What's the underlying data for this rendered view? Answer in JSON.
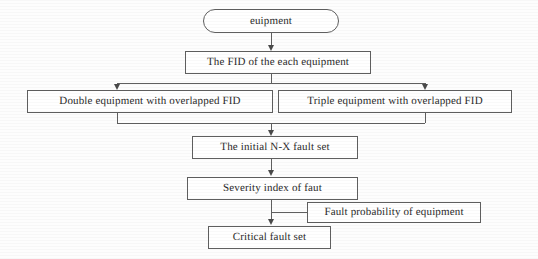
{
  "diagram": {
    "type": "flowchart",
    "orientation": "top-to-bottom",
    "background_color": "#fdfdfd",
    "line_color": "#5f5f5f",
    "text_color": "#2b2b2b",
    "nodes": [
      {
        "id": "start",
        "shape": "oval",
        "label": "euipment"
      },
      {
        "id": "fid",
        "shape": "rectangle",
        "label": "The FID of the each equipment"
      },
      {
        "id": "double",
        "shape": "rectangle",
        "label": "Double equipment with overlapped FID"
      },
      {
        "id": "triple",
        "shape": "rectangle",
        "label": "Triple equipment with overlapped FID"
      },
      {
        "id": "initial_set",
        "shape": "rectangle",
        "label": "The initial N-X fault set"
      },
      {
        "id": "severity",
        "shape": "rectangle",
        "label": "Severity index of faut"
      },
      {
        "id": "probability",
        "shape": "rectangle",
        "label": "Fault probability of equipment"
      },
      {
        "id": "critical",
        "shape": "rectangle",
        "label": "Critical fault set"
      }
    ],
    "edges": [
      {
        "from": "start",
        "to": "fid",
        "style": "arrow-down"
      },
      {
        "from": "fid",
        "to": "double",
        "style": "split-left-arrow-down"
      },
      {
        "from": "fid",
        "to": "triple",
        "style": "split-right-arrow-down"
      },
      {
        "from": "double",
        "to": "initial_set",
        "style": "merge-arrow-down"
      },
      {
        "from": "triple",
        "to": "initial_set",
        "style": "merge-arrow-down"
      },
      {
        "from": "initial_set",
        "to": "severity",
        "style": "arrow-down"
      },
      {
        "from": "severity",
        "to": "critical",
        "style": "arrow-down"
      },
      {
        "from": "probability",
        "to": "critical",
        "style": "elbow-left-into-trunk"
      }
    ]
  }
}
